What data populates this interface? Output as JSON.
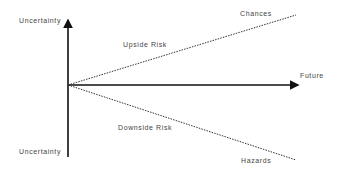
{
  "diagram": {
    "type": "risk-uncertainty-diagram",
    "colors": {
      "axis": "#111111",
      "dotted": "#333333",
      "text": "#444444",
      "background": "#ffffff"
    },
    "axes": {
      "vertical_top_label": "Uncertainty",
      "vertical_bottom_label": "Uncertainty",
      "horizontal_label": "Future"
    },
    "branches": [
      {
        "name": "upside",
        "line_label": "Upside Risk",
        "end_label": "Chances"
      },
      {
        "name": "downside",
        "line_label": "Downside Risk",
        "end_label": "Hazards"
      }
    ]
  }
}
